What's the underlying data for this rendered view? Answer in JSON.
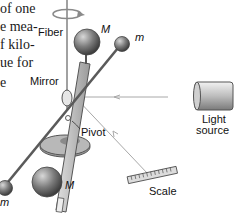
{
  "body_text_fragments": [
    "of one",
    "e mea-",
    "f kilo-",
    "ue for",
    "e"
  ],
  "labels": {
    "fiber": "Fiber",
    "mirror": "Mirror",
    "pivot": "Pivot",
    "light_source_line1": "Light",
    "light_source_line2": "source",
    "scale": "Scale",
    "large_mass_top": "M",
    "large_mass_bottom": "M",
    "small_mass_top": "m",
    "small_mass_bottom": "m"
  },
  "colors": {
    "sphere": "#7a7a7a",
    "rod": "#555555",
    "beam": "#b0b0b0",
    "base": "#8c8c8c"
  }
}
